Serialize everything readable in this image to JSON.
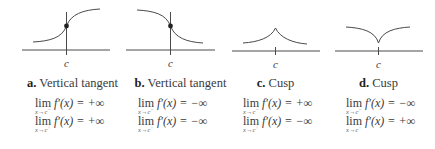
{
  "panels": [
    {
      "letter": "a.",
      "title": "Vertical tangent",
      "axis_label": "c",
      "limits": [
        {
          "op": "lim",
          "sub": "x→c",
          "side": "−",
          "expr": "f′(x) = +∞"
        },
        {
          "op": "lim",
          "sub": "x→c",
          "side": "+",
          "expr": "f′(x) = +∞"
        }
      ]
    },
    {
      "letter": "b.",
      "title": "Vertical tangent",
      "axis_label": "c",
      "limits": [
        {
          "op": "lim",
          "sub": "x→c",
          "side": "−",
          "expr": "f′(x) = −∞"
        },
        {
          "op": "lim",
          "sub": "x→c",
          "side": "+",
          "expr": "f′(x) = −∞"
        }
      ]
    },
    {
      "letter": "c.",
      "title": "Cusp",
      "axis_label": "c",
      "limits": [
        {
          "op": "lim",
          "sub": "x→c",
          "side": "−",
          "expr": "f′(x) = +∞"
        },
        {
          "op": "lim",
          "sub": "x→c",
          "side": "+",
          "expr": "f′(x) = −∞"
        }
      ]
    },
    {
      "letter": "d.",
      "title": "Cusp",
      "axis_label": "c",
      "limits": [
        {
          "op": "lim",
          "sub": "x→c",
          "side": "−",
          "expr": "f′(x) = −∞"
        },
        {
          "op": "lim",
          "sub": "x→c",
          "side": "+",
          "expr": "f′(x) = +∞"
        }
      ]
    }
  ],
  "colors": {
    "line": "#4a4a4a",
    "text": "#3a3a3a"
  }
}
